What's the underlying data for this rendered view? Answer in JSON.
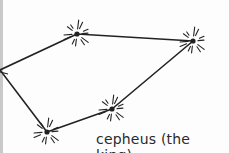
{
  "title": "cepheus (the king)",
  "colors": {
    "ink": "#222222",
    "paper": "#fdfdfd"
  },
  "stars": [
    {
      "id": "left-edge"
    },
    {
      "id": "top-left"
    },
    {
      "id": "top-right"
    },
    {
      "id": "bottom-middle"
    },
    {
      "id": "bottom-left"
    }
  ],
  "connections": [
    [
      "left-edge",
      "top-left"
    ],
    [
      "top-left",
      "top-right"
    ],
    [
      "left-edge",
      "bottom-left"
    ],
    [
      "bottom-left",
      "bottom-middle"
    ],
    [
      "bottom-middle",
      "top-right"
    ]
  ]
}
